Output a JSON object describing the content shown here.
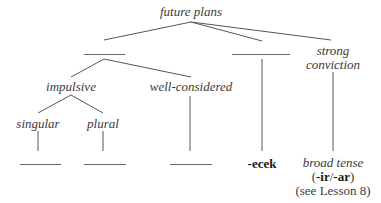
{
  "diagram": {
    "root": "future plans",
    "branches": {
      "left_blank": "",
      "middle_blank": "",
      "right": [
        "strong",
        "conviction"
      ]
    },
    "left_children": {
      "impulsive": "impulsive",
      "well_considered": "well-considered"
    },
    "impulsive_children": {
      "singular": "singular",
      "plural": "plural"
    },
    "leaves": {
      "singular_answer": "",
      "plural_answer": "",
      "well_considered_answer": "",
      "middle_answer": "-ecek",
      "strong_conviction_answer": {
        "line1": "broad tense",
        "line2_open": "(",
        "line2_ir": "-ir",
        "line2_slash": "/",
        "line2_ar": "-ar",
        "line2_close": ")",
        "line3": "(see Lesson 8)"
      }
    }
  }
}
